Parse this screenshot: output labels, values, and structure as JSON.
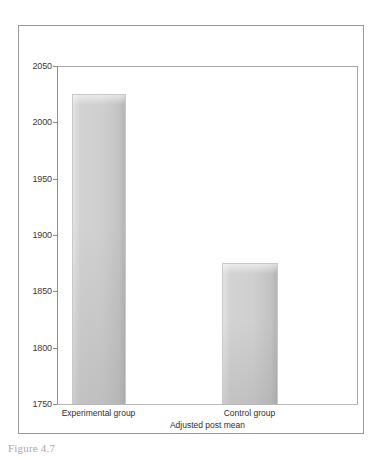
{
  "figure": {
    "caption": "Figure 4.7"
  },
  "chart_data": {
    "type": "bar",
    "title": "",
    "subtitle": "",
    "categories": [
      "Experimental group",
      "Control group"
    ],
    "values": [
      2025,
      1875
    ],
    "series": [
      {
        "name": "Adjusted post mean",
        "values": [
          2025,
          1875
        ]
      }
    ],
    "xlabel": "Adjusted post mean",
    "ylabel": "",
    "ylim": [
      1750,
      2050
    ],
    "ytick_labels": [
      "2050",
      "2000",
      "1950",
      "1900",
      "1850",
      "1800",
      "1750"
    ],
    "ytick_values": [
      2050,
      2000,
      1950,
      1900,
      1850,
      1800,
      1750
    ],
    "ytick_step": 50,
    "grid": false,
    "legend": false,
    "legend_position": "none",
    "bar_color": "#cfcfcf",
    "bar_border_color": "#c9c9c9",
    "axis_color": "#8f8f8f",
    "text_color": "#2e2e2e"
  }
}
